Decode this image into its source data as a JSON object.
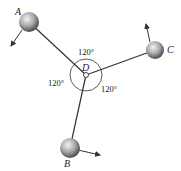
{
  "diagram": {
    "center_label": "D",
    "points": [
      {
        "id": "A",
        "label": "A"
      },
      {
        "id": "B",
        "label": "B"
      },
      {
        "id": "C",
        "label": "C"
      }
    ],
    "angles": [
      {
        "between": "A-C",
        "label": "120°"
      },
      {
        "between": "A-B",
        "label": "120°"
      },
      {
        "between": "B-C",
        "label": "120°"
      }
    ],
    "colors": {
      "line": "#333333",
      "ball_light": "#f2f2f2",
      "ball_dark": "#555555"
    }
  }
}
